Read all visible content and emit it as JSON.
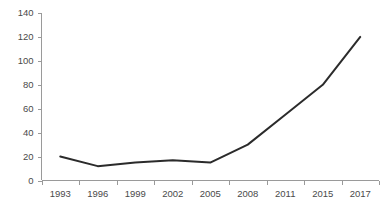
{
  "chart_data": {
    "type": "line",
    "title": "",
    "subtitle": "",
    "xlabel": "",
    "ylabel": "",
    "categories": [
      "1993",
      "1996",
      "1999",
      "2002",
      "2005",
      "2008",
      "2011",
      "2015",
      "2017"
    ],
    "values": [
      20,
      12,
      15,
      17,
      15,
      30,
      55,
      80,
      120
    ],
    "series": [
      {
        "name": "",
        "values": [
          20,
          12,
          15,
          17,
          15,
          30,
          55,
          80,
          120
        ]
      }
    ],
    "ylim": [
      0,
      140
    ],
    "y_ticks": [
      0,
      20,
      40,
      60,
      80,
      100,
      120,
      140
    ],
    "y_tick_labels": [
      "0",
      "20",
      "40",
      "60",
      "80",
      "100",
      "120",
      "140"
    ],
    "x_tick_labels": [
      "1993",
      "1996",
      "1999",
      "2002",
      "2005",
      "2008",
      "2011",
      "2015",
      "2017"
    ],
    "grid": false,
    "legend": false,
    "legend_position": "none",
    "line_color": "#2b2b2b",
    "axis_color": "#9a9a9a",
    "tick_label_color": "#4a4a4a",
    "background_color": "#ffffff",
    "markers": false,
    "line_width": 2
  }
}
